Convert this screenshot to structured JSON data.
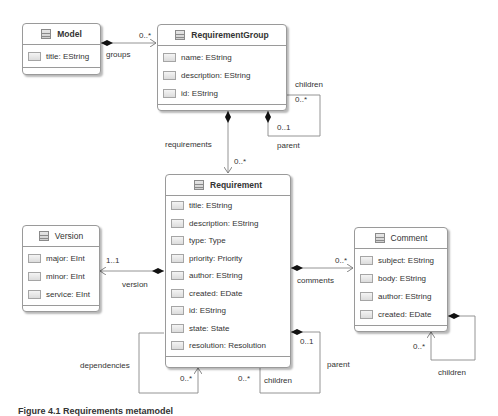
{
  "classes": {
    "model": {
      "name": "Model",
      "attributes": [
        "title: EString"
      ]
    },
    "requirement_group": {
      "name": "RequirementGroup",
      "attributes": [
        "name: EString",
        "description: EString",
        "id: EString"
      ]
    },
    "requirement": {
      "name": "Requirement",
      "attributes": [
        "title: EString",
        "description: EString",
        "type: Type",
        "priority: Priority",
        "author: EString",
        "created: EDate",
        "id: EString",
        "state: State",
        "resolution: Resolution"
      ]
    },
    "version": {
      "name": "Version",
      "attributes": [
        "major: EInt",
        "minor: EInt",
        "service: EInt"
      ]
    },
    "comment": {
      "name": "Comment",
      "attributes": [
        "subject: EString",
        "body: EString",
        "author: EString",
        "created: EDate"
      ]
    }
  },
  "associations": {
    "groups": {
      "role": "groups",
      "multiplicity": "0..*"
    },
    "group_children": {
      "role": "children",
      "multiplicity": "0..*"
    },
    "group_parent": {
      "role": "parent",
      "multiplicity": "0..1"
    },
    "requirements": {
      "role": "requirements",
      "multiplicity": "0..*"
    },
    "version": {
      "role": "version",
      "multiplicity": "1..1"
    },
    "comments": {
      "role": "comments",
      "multiplicity": "0..*"
    },
    "dependencies": {
      "role": "dependencies",
      "multiplicity": "0..*"
    },
    "req_children": {
      "role": "children",
      "multiplicity": "0..*"
    },
    "req_parent": {
      "role": "parent",
      "multiplicity": "0..1"
    },
    "comment_children": {
      "role": "children",
      "multiplicity": "0..*"
    }
  },
  "caption": "Figure 4.1   Requirements metamodel"
}
